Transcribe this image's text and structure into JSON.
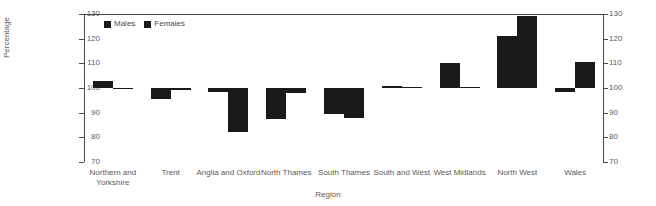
{
  "chart_data": {
    "type": "bar",
    "title": "",
    "xlabel": "Region",
    "ylabel": "Percentage",
    "ylim": [
      70,
      130
    ],
    "yticks": [
      70,
      80,
      90,
      100,
      110,
      120,
      130
    ],
    "baseline": 100,
    "grid": false,
    "dual_axis": true,
    "legend_position": "top-left",
    "categories": [
      "Northern and Yorkshire",
      "Trent",
      "Anglia and Oxford",
      "North Thames",
      "South Thames",
      "South and West",
      "West Midlands",
      "North West",
      "Wales"
    ],
    "series": [
      {
        "name": "Males",
        "color": "#1a1a1a",
        "values": [
          103.0,
          95.5,
          98.5,
          87.5,
          89.5,
          101.0,
          110.0,
          121.0,
          98.5
        ]
      },
      {
        "name": "Females",
        "color": "#1a1a1a",
        "values": [
          100.0,
          99.0,
          82.0,
          98.0,
          88.0,
          100.5,
          100.3,
          129.0,
          110.5
        ]
      }
    ]
  },
  "legend": {
    "items": [
      {
        "label": "Males"
      },
      {
        "label": "Females"
      }
    ]
  },
  "axis": {
    "y_title": "Percentage",
    "x_title": "Region",
    "tick_labels": [
      "130",
      "120",
      "110",
      "100",
      "90",
      "80",
      "70"
    ]
  },
  "colors": {
    "bar": "#1a1a1a",
    "axis": "#4a4a4a",
    "text": "#5a5a5a",
    "background": "#ffffff"
  }
}
